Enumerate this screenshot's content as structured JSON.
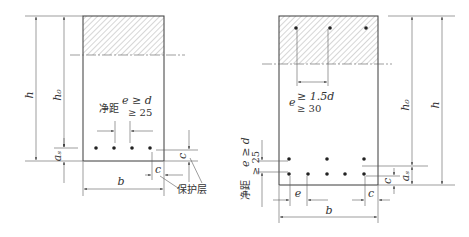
{
  "diagrams": [
    {
      "id": "single-row",
      "labels": {
        "h": "h",
        "h0": "h₀",
        "as": "aₛ",
        "b": "b",
        "c_bottom": "c",
        "c_side": "c",
        "clear_spacing": "净距",
        "e_rule_1": "e ≥ d",
        "e_rule_2": "≥ 25",
        "cover": "保护层"
      },
      "bar_count": 4
    },
    {
      "id": "double-row",
      "labels": {
        "h": "h",
        "h0": "h₀",
        "as": "aₛ",
        "b": "b",
        "c_bottom": "c",
        "c_side": "c",
        "e_bottom": "e",
        "e_top_prefix": "e",
        "e_top_rule_1": "≥ 1.5d",
        "e_top_rule_2": "≥ 30",
        "clear_spacing": "净距",
        "e_rule_1": "e ≥ d",
        "e_rule_2": "≥ 25"
      },
      "top_bar_count": 3,
      "bottom_row1_count": 5,
      "bottom_row2_count": 3
    }
  ],
  "colors": {
    "line": "#3a3a3a",
    "hatch": "#8a8a8a",
    "bar": "#222222"
  }
}
